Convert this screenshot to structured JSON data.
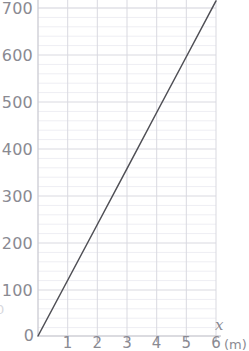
{
  "chart_data": {
    "type": "line",
    "title": "",
    "subtitle": "",
    "xlabel": "x",
    "ylabel": "",
    "x_unit": "(m)",
    "y_unit": "",
    "xlim": [
      0,
      6
    ],
    "ylim": [
      0,
      720
    ],
    "grid": true,
    "minor_grid": true,
    "minor_grid_step_y": 20,
    "legend": "none",
    "x_ticks": [
      0,
      1,
      2,
      3,
      4,
      5,
      6
    ],
    "x_tick_labels": [
      "0",
      "1",
      "2",
      "3",
      "4",
      "5",
      "6"
    ],
    "y_ticks": [
      0,
      100,
      200,
      300,
      400,
      500,
      600,
      700
    ],
    "y_tick_labels": [
      "0",
      "100",
      "200",
      "300",
      "400",
      "500",
      "600",
      "700"
    ],
    "series": [
      {
        "name": "line",
        "color": "#4f4f55",
        "x": [
          0,
          1,
          2,
          3,
          4,
          5,
          6
        ],
        "values": [
          0,
          119,
          238,
          357,
          477,
          596,
          715
        ]
      }
    ],
    "annotations": []
  },
  "axes": {
    "x_axis_name": "x",
    "x_unit_label": "(m)",
    "origin_label": "0"
  },
  "edge": {
    "clipped_left_mark": "0"
  },
  "colors": {
    "line": "#4f4f55",
    "major_grid": "#d9d9e0",
    "minor_grid": "#eeeef3",
    "axis": "#cfcfd6",
    "text": "#8a8a92",
    "background": "#ffffff"
  }
}
